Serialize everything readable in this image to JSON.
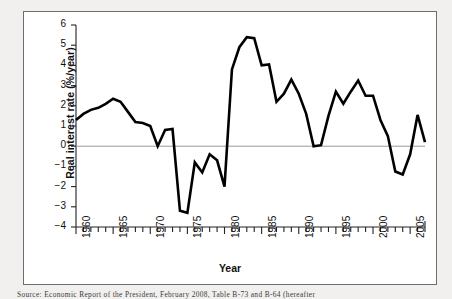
{
  "chart_data": {
    "type": "line",
    "title": "",
    "subtitle": "",
    "xlabel": "Year",
    "ylabel": "Real interest rate (%/year)",
    "xlim": [
      1960,
      2007
    ],
    "ylim": [
      -4,
      6
    ],
    "grid": false,
    "legend": "none",
    "zero_line": 0,
    "yticks": [
      6,
      5,
      4,
      3,
      2,
      1,
      0,
      -1,
      -2,
      -3,
      -4
    ],
    "ytick_labels": [
      "6",
      "5",
      "4",
      "3",
      "2",
      "1",
      "0",
      "−1",
      "−2",
      "−3",
      "−4"
    ],
    "xticks": [
      1960,
      1965,
      1970,
      1975,
      1980,
      1985,
      1990,
      1995,
      2000,
      2005
    ],
    "xtick_labels": [
      "1960",
      "1965",
      "1970",
      "1975",
      "1980",
      "1985",
      "1990",
      "1995",
      "2000",
      "2005"
    ],
    "xtick_minor_interval": 1,
    "series": [
      {
        "name": "Real interest rate",
        "color": "#000000",
        "line_width": 2.6,
        "x": [
          1960,
          1961,
          1962,
          1963,
          1964,
          1965,
          1966,
          1967,
          1968,
          1969,
          1970,
          1971,
          1972,
          1973,
          1974,
          1975,
          1976,
          1977,
          1978,
          1979,
          1980,
          1981,
          1982,
          1983,
          1984,
          1985,
          1986,
          1987,
          1988,
          1989,
          1990,
          1991,
          1992,
          1993,
          1994,
          1995,
          1996,
          1997,
          1998,
          1999,
          2000,
          2001,
          2002,
          2003,
          2004,
          2005,
          2006,
          2007
        ],
        "values": [
          1.3,
          1.6,
          1.8,
          1.9,
          2.1,
          2.35,
          2.2,
          1.7,
          1.2,
          1.15,
          1.0,
          0.0,
          0.8,
          0.85,
          -3.2,
          -3.3,
          -0.8,
          -1.3,
          -0.4,
          -0.7,
          -2.0,
          3.8,
          4.9,
          5.4,
          5.35,
          4.0,
          4.05,
          2.2,
          2.6,
          3.3,
          2.6,
          1.6,
          0.0,
          0.05,
          1.5,
          2.7,
          2.1,
          2.7,
          3.25,
          2.5,
          2.5,
          1.3,
          0.5,
          -1.25,
          -1.4,
          -0.4,
          1.55,
          0.2
        ]
      }
    ]
  },
  "figure": {
    "xlabel": "Year",
    "ylabel": "Real interest rate (%/year)"
  },
  "caption": {
    "text": "Source: Economic Report of the President, February 2008, Table B-73 and B-64 (hereafter"
  }
}
